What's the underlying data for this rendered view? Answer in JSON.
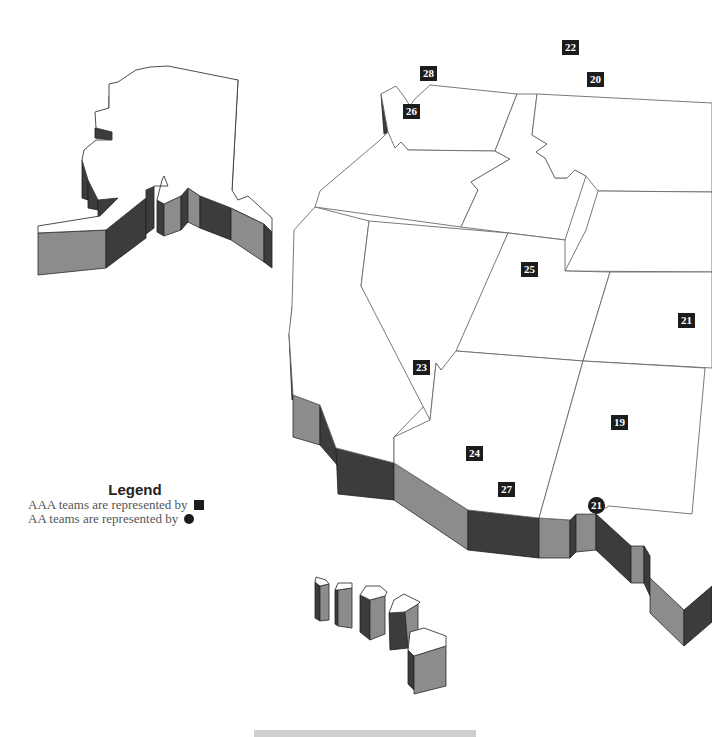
{
  "map": {
    "title": "Minor league baseball team locations - western United States",
    "colors": {
      "marker": "#1c1c1c",
      "wall_light": "#8c8c8c",
      "wall_dark": "#3c3c3c",
      "border": "#6a6a6a"
    }
  },
  "legend": {
    "title": "Legend",
    "aaa_label": "AAA teams are represented by",
    "aa_label": "AA teams are represented by",
    "aaa_symbol": "square-icon",
    "aa_symbol": "circle-icon"
  },
  "markers": [
    {
      "id": "22",
      "label": "22",
      "shape": "square",
      "x": 562,
      "y": 40
    },
    {
      "id": "20",
      "label": "20",
      "shape": "square",
      "x": 587,
      "y": 72
    },
    {
      "id": "28",
      "label": "28",
      "shape": "square",
      "x": 420,
      "y": 66
    },
    {
      "id": "26",
      "label": "26",
      "shape": "square",
      "x": 403,
      "y": 104
    },
    {
      "id": "25",
      "label": "25",
      "shape": "square",
      "x": 521,
      "y": 262
    },
    {
      "id": "21a",
      "label": "21",
      "shape": "square",
      "x": 678,
      "y": 313
    },
    {
      "id": "23",
      "label": "23",
      "shape": "square",
      "x": 413,
      "y": 360
    },
    {
      "id": "19",
      "label": "19",
      "shape": "square",
      "x": 611,
      "y": 415
    },
    {
      "id": "24",
      "label": "24",
      "shape": "square",
      "x": 466,
      "y": 446
    },
    {
      "id": "27",
      "label": "27",
      "shape": "square",
      "x": 498,
      "y": 482
    },
    {
      "id": "21b",
      "label": "21",
      "shape": "circle",
      "x": 588,
      "y": 497
    }
  ]
}
